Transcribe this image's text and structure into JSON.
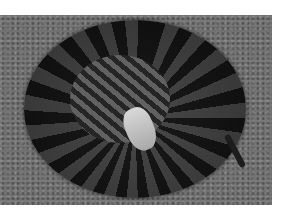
{
  "image": {
    "subject": "coiled snake",
    "background": "gravel",
    "colors": {
      "gravel": "#6e6e6e",
      "snake_dark": "#1a1a1a",
      "head": "#d8d8d8",
      "border": "#ffffff"
    }
  }
}
